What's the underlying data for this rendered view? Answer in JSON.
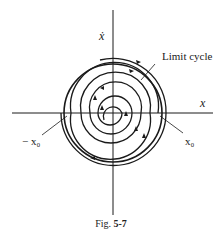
{
  "figure": {
    "type": "phase-plane diagram",
    "caption_prefix": "Fig.",
    "caption_number": "5-7",
    "labels": {
      "y_axis": "ẋ",
      "x_axis": "x",
      "limit_cycle": "Limit cycle",
      "neg_x0": "− x₀",
      "pos_x0": "x₀"
    },
    "colors": {
      "stroke": "#1a1a1a",
      "background": "#ffffff"
    },
    "geometry": {
      "origin": [
        113,
        113
      ],
      "limit_cycle_radius": 49,
      "spiral_direction": "clockwise",
      "inner_spiral": "outward toward limit cycle",
      "outer_spiral": "inward toward limit cycle"
    }
  }
}
